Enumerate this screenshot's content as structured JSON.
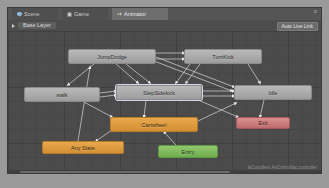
{
  "window": {
    "tabs": [
      {
        "label": "Scene",
        "icon": "scene-icon",
        "active": false
      },
      {
        "label": "Game",
        "icon": "game-icon",
        "active": false
      },
      {
        "label": "Animator",
        "icon": "animator-icon",
        "active": true
      }
    ]
  },
  "toolbar": {
    "layer_label": "Base Layer",
    "live_link_label": "Auto Live Link",
    "gear_glyph": "≡"
  },
  "graph": {
    "path_label": "kiCotrollers.AnControllac.controller",
    "nodes": [
      {
        "id": "jumpdodge",
        "label": "JumpDodge",
        "style": "gray",
        "x": 60,
        "y": 18,
        "w": 88,
        "h": 15
      },
      {
        "id": "turnkick",
        "label": "TurnKick",
        "style": "gray",
        "x": 176,
        "y": 18,
        "w": 78,
        "h": 15
      },
      {
        "id": "walk",
        "label": "walk",
        "style": "gray",
        "x": 16,
        "y": 56,
        "w": 76,
        "h": 15
      },
      {
        "id": "stepsidekick",
        "label": "StepSidekick",
        "style": "gray",
        "x": 108,
        "y": 54,
        "w": 86,
        "h": 15
      },
      {
        "id": "idle",
        "label": "Idle",
        "style": "gray",
        "x": 226,
        "y": 54,
        "w": 78,
        "h": 15
      },
      {
        "id": "cartwheel",
        "label": "Cartwheel",
        "style": "orange",
        "x": 102,
        "y": 86,
        "w": 88,
        "h": 15
      },
      {
        "id": "anystate",
        "label": "Any State",
        "style": "orange",
        "x": 34,
        "y": 110,
        "w": 82,
        "h": 13
      },
      {
        "id": "exit",
        "label": "Exit",
        "style": "red",
        "x": 228,
        "y": 86,
        "w": 54,
        "h": 12
      },
      {
        "id": "entry",
        "label": "Entry",
        "style": "green",
        "x": 150,
        "y": 114,
        "w": 60,
        "h": 13
      }
    ],
    "transitions": [
      {
        "from": "jumpdodge",
        "to": "walk"
      },
      {
        "from": "jumpdodge",
        "to": "stepsidekick"
      },
      {
        "from": "jumpdodge",
        "to": "turnkick"
      },
      {
        "from": "jumpdodge",
        "to": "idle"
      },
      {
        "from": "turnkick",
        "to": "stepsidekick"
      },
      {
        "from": "turnkick",
        "to": "idle"
      },
      {
        "from": "walk",
        "to": "stepsidekick"
      },
      {
        "from": "walk",
        "to": "cartwheel"
      },
      {
        "from": "stepsidekick",
        "to": "idle"
      },
      {
        "from": "stepsidekick",
        "to": "cartwheel"
      },
      {
        "from": "stepsidekick",
        "to": "exit"
      },
      {
        "from": "cartwheel",
        "to": "idle"
      },
      {
        "from": "cartwheel",
        "to": "anystate"
      },
      {
        "from": "anystate",
        "to": "jumpdodge"
      },
      {
        "from": "entry",
        "to": "cartwheel"
      },
      {
        "from": "idle",
        "to": "exit"
      }
    ]
  }
}
